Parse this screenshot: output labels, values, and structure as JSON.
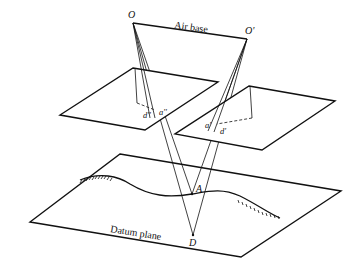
{
  "diagram": {
    "labels": {
      "O": "O",
      "O_prime": "O'",
      "air_base": "Air base",
      "a_double": "a''",
      "d_double": "d''",
      "a_prime": "a'",
      "d_prime": "d'",
      "A": "A",
      "D": "D",
      "datum_plane": "Datum plane"
    },
    "nodes": {
      "O": [
        133,
        23
      ],
      "O_prime": [
        247,
        39
      ],
      "A": [
        192,
        194
      ],
      "D": [
        193,
        235
      ]
    },
    "planes": {
      "left_photo": [
        [
          133,
          68
        ],
        [
          218,
          82
        ],
        [
          145,
          130
        ],
        [
          60,
          115
        ]
      ],
      "right_photo": [
        [
          249,
          86
        ],
        [
          335,
          101
        ],
        [
          262,
          150
        ],
        [
          175,
          134
        ]
      ],
      "datum": [
        [
          120,
          154
        ],
        [
          341,
          191
        ],
        [
          241,
          257
        ],
        [
          30,
          222
        ]
      ]
    }
  }
}
